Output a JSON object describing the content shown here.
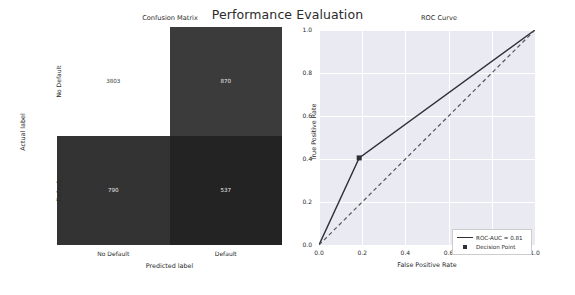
{
  "figure": {
    "suptitle": "Performance Evaluation",
    "background": "#ffffff"
  },
  "confusion_matrix_panel": {
    "title": "Confusion Matrix",
    "xlabel": "Predicted label",
    "ylabel": "Actual label",
    "xticklabels": [
      "No Default",
      "Default"
    ],
    "yticklabels": [
      "No Default",
      "Default"
    ],
    "cells": {
      "tn": "3803",
      "fp": "870",
      "fn": "790",
      "tp": "537"
    },
    "cell_colors": {
      "tn": "#ffffff",
      "fp": "#3b3b3b",
      "fn": "#333333",
      "tp": "#232323"
    },
    "cell_text_colors": {
      "tn": "#3a3a3a",
      "fp": "#e8e8e8",
      "fn": "#e8e8e8",
      "tp": "#e8e8e8"
    }
  },
  "roc_panel": {
    "title": "ROC Curve",
    "xlabel": "False Positive Rate",
    "ylabel": "True Positive Rate",
    "xticklabels": [
      "0.0",
      "0.2",
      "0.4",
      "0.6",
      "0.8",
      "1.0"
    ],
    "yticklabels": [
      "0.0",
      "0.2",
      "0.4",
      "0.6",
      "0.8",
      "1.0"
    ],
    "legend": {
      "roc_label": "ROC-AUC = 0.81",
      "point_label": "Decision Point"
    },
    "axes_facecolor": "#eaeaf2",
    "grid_color": "#ffffff",
    "curve_color": "#2f2f38",
    "chance_color": "#555560"
  },
  "chart_data": [
    {
      "type": "heatmap",
      "title": "Confusion Matrix",
      "xlabel": "Predicted label",
      "ylabel": "Actual label",
      "x_categories": [
        "No Default",
        "Default"
      ],
      "y_categories": [
        "No Default",
        "Default"
      ],
      "values": [
        [
          3803,
          870
        ],
        [
          790,
          537
        ]
      ],
      "annotations": [
        [
          "3803",
          "870"
        ],
        [
          "790",
          "537"
        ]
      ],
      "colormap": "gray_reversed",
      "grid": false,
      "legend": "none"
    },
    {
      "type": "line",
      "title": "ROC Curve",
      "xlabel": "False Positive Rate",
      "ylabel": "True Positive Rate",
      "xlim": [
        0.0,
        1.0
      ],
      "ylim": [
        0.0,
        1.0
      ],
      "xticks": [
        0.0,
        0.2,
        0.4,
        0.6,
        0.8,
        1.0
      ],
      "yticks": [
        0.0,
        0.2,
        0.4,
        0.6,
        0.8,
        1.0
      ],
      "grid": true,
      "legend_position": "lower right",
      "series": [
        {
          "name": "ROC-AUC = 0.81",
          "style": "solid",
          "x": [
            0.0,
            0.186,
            1.0
          ],
          "y": [
            0.0,
            0.405,
            1.0
          ]
        },
        {
          "name": "chance",
          "style": "dashed",
          "x": [
            0.0,
            1.0
          ],
          "y": [
            0.0,
            1.0
          ]
        }
      ],
      "points": [
        {
          "name": "Decision Point",
          "marker": "square",
          "x": 0.186,
          "y": 0.405
        }
      ]
    }
  ]
}
